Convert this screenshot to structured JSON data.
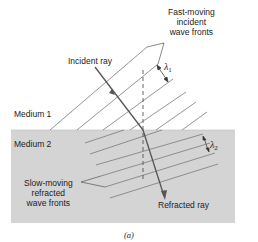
{
  "figure": {
    "caption": "(a)",
    "colors": {
      "background": "#ffffff",
      "medium2_fill": "#d4d4d4",
      "line": "#6a6a6a",
      "ray": "#555555",
      "text": "#222222"
    }
  },
  "labels": {
    "incident_fronts": [
      "Fast-moving",
      "incident",
      "wave fronts"
    ],
    "incident_ray": "Incident ray",
    "lambda1": {
      "symbol": "λ",
      "sub": "1"
    },
    "medium1": "Medium 1",
    "medium2": "Medium 2",
    "lambda2": {
      "symbol": "λ",
      "sub": "2"
    },
    "refracted_fronts": [
      "Slow-moving",
      "refracted",
      "wave fronts"
    ],
    "refracted_ray": "Refracted ray"
  }
}
